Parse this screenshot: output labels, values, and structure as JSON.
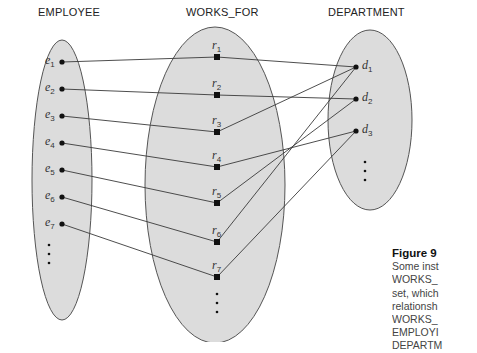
{
  "diagram": {
    "sets": [
      {
        "id": "employee",
        "title": "EMPLOYEE",
        "cx": 62,
        "cy": 180,
        "rx": 30,
        "ry": 140,
        "title_x": 38,
        "title_y": 16
      },
      {
        "id": "works_for",
        "title": "WORKS_FOR",
        "cx": 215,
        "cy": 185,
        "rx": 70,
        "ry": 158,
        "title_x": 186,
        "title_y": 16
      },
      {
        "id": "department",
        "title": "DEPARTMENT",
        "cx": 370,
        "cy": 120,
        "rx": 42,
        "ry": 90,
        "title_x": 328,
        "title_y": 16
      }
    ],
    "employees": [
      {
        "base": "e",
        "sub": "1",
        "x": 62,
        "y": 62
      },
      {
        "base": "e",
        "sub": "2",
        "x": 62,
        "y": 89
      },
      {
        "base": "e",
        "sub": "3",
        "x": 62,
        "y": 116
      },
      {
        "base": "e",
        "sub": "4",
        "x": 62,
        "y": 143
      },
      {
        "base": "e",
        "sub": "5",
        "x": 62,
        "y": 170
      },
      {
        "base": "e",
        "sub": "6",
        "x": 62,
        "y": 197
      },
      {
        "base": "e",
        "sub": "7",
        "x": 62,
        "y": 224
      }
    ],
    "relationships": [
      {
        "base": "r",
        "sub": "1",
        "x": 217,
        "y": 57
      },
      {
        "base": "r",
        "sub": "2",
        "x": 217,
        "y": 95
      },
      {
        "base": "r",
        "sub": "3",
        "x": 217,
        "y": 132
      },
      {
        "base": "r",
        "sub": "4",
        "x": 217,
        "y": 167
      },
      {
        "base": "r",
        "sub": "5",
        "x": 217,
        "y": 203
      },
      {
        "base": "r",
        "sub": "6",
        "x": 217,
        "y": 242
      },
      {
        "base": "r",
        "sub": "7",
        "x": 217,
        "y": 277
      }
    ],
    "departments": [
      {
        "base": "d",
        "sub": "1",
        "x": 356,
        "y": 67
      },
      {
        "base": "d",
        "sub": "2",
        "x": 356,
        "y": 99
      },
      {
        "base": "d",
        "sub": "3",
        "x": 356,
        "y": 131
      }
    ],
    "links": [
      {
        "from": "e1",
        "to": "r1"
      },
      {
        "from": "e2",
        "to": "r2"
      },
      {
        "from": "e3",
        "to": "r3"
      },
      {
        "from": "e4",
        "to": "r4"
      },
      {
        "from": "e5",
        "to": "r5"
      },
      {
        "from": "e6",
        "to": "r6"
      },
      {
        "from": "e7",
        "to": "r7"
      },
      {
        "from": "r1",
        "to": "d1"
      },
      {
        "from": "r2",
        "to": "d2"
      },
      {
        "from": "r3",
        "to": "d1"
      },
      {
        "from": "r4",
        "to": "d3"
      },
      {
        "from": "r5",
        "to": "d2"
      },
      {
        "from": "r6",
        "to": "d1"
      },
      {
        "from": "r7",
        "to": "d3"
      }
    ],
    "ellipsis_marks": [
      {
        "set": "employee",
        "x": 49,
        "ys": [
          245,
          254,
          263
        ]
      },
      {
        "set": "works_for",
        "x": 217,
        "ys": [
          294,
          303,
          312
        ]
      },
      {
        "set": "department",
        "x": 365,
        "ys": [
          162,
          171,
          180
        ]
      }
    ],
    "colors": {
      "fill": "#dcdcdc",
      "stroke": "#555555",
      "line": "#3a3a3a",
      "node": "#111111"
    }
  },
  "caption": {
    "figure": "Figure 9",
    "lines": [
      "Some inst",
      "WORKS_",
      "set, which",
      "relationsh",
      "WORKS_",
      "EMPLOYI",
      "DEPARTM"
    ]
  }
}
